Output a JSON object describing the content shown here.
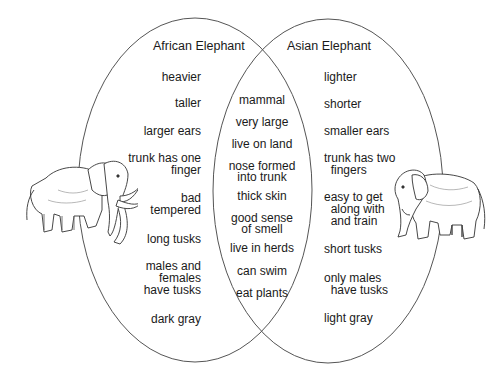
{
  "diagram": {
    "type": "venn",
    "sets": [
      {
        "title": "African Elephant",
        "items": [
          "heavier",
          "taller",
          "larger ears",
          "trunk has one\nfinger",
          "bad\ntempered",
          "long tusks",
          "males and\nfemales\nhave tusks",
          "dark gray"
        ]
      },
      {
        "title": "Asian Elephant",
        "items": [
          "lighter",
          "shorter",
          "smaller ears",
          "trunk has two\n  fingers",
          "easy to get\n  along with\n  and train",
          "short tusks",
          "only males\n  have tusks",
          "light gray"
        ]
      }
    ],
    "shared": {
      "items": [
        "mammal",
        "very large",
        "live on land",
        "nose formed\ninto trunk",
        "thick skin",
        "good sense\nof smell",
        "live in herds",
        "can swim",
        "eat plants"
      ]
    },
    "illustrations": [
      {
        "name": "african-elephant-illustration",
        "side": "left"
      },
      {
        "name": "asian-elephant-illustration",
        "side": "right"
      }
    ],
    "colors": {
      "line": "#444444",
      "text": "#1a1a1a",
      "background": "#ffffff"
    }
  }
}
